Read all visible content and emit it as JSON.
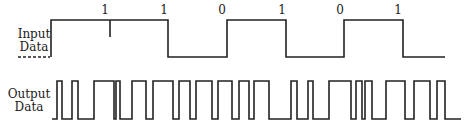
{
  "diagram": {
    "input_label_line1": "Input",
    "input_label_line2": "Data",
    "output_label_line1": "Output",
    "output_label_line2": "Data",
    "bits": [
      {
        "value": "1",
        "x": 81
      },
      {
        "value": "1",
        "x": 140
      },
      {
        "value": "0",
        "x": 198
      },
      {
        "value": "1",
        "x": 257
      },
      {
        "value": "0",
        "x": 316
      },
      {
        "value": "1",
        "x": 374
      }
    ],
    "stroke_color": "#222222"
  }
}
